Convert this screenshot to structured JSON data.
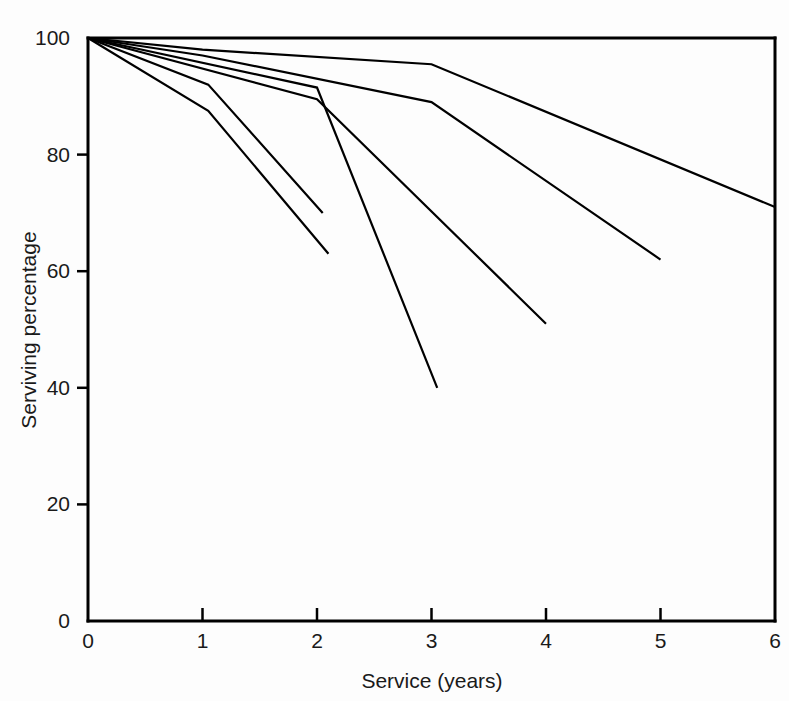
{
  "chart_data": {
    "type": "line",
    "title": "",
    "subtitle": "",
    "xlabel": "Service (years)",
    "ylabel": "Serviving percentage",
    "xlim": [
      0,
      6
    ],
    "ylim": [
      0,
      100
    ],
    "xticks": [
      0,
      1,
      2,
      3,
      4,
      5,
      6
    ],
    "xticklabels": [
      "0",
      "1",
      "2",
      "3",
      "4",
      "5",
      "6"
    ],
    "yticks": [
      0,
      20,
      40,
      60,
      80,
      100
    ],
    "yticklabels": [
      "0",
      "20",
      "40",
      "60",
      "80",
      "100"
    ],
    "grid": false,
    "legend": null,
    "legend_position": "none",
    "annotations": [],
    "series": [
      {
        "name": "cohort-1",
        "x": [
          0,
          1,
          3,
          6
        ],
        "values": [
          100,
          98,
          95.5,
          71
        ]
      },
      {
        "name": "cohort-2",
        "x": [
          0,
          1,
          3,
          5
        ],
        "values": [
          100,
          97,
          89,
          62
        ]
      },
      {
        "name": "cohort-3",
        "x": [
          0,
          2,
          4
        ],
        "values": [
          100,
          89.5,
          51
        ]
      },
      {
        "name": "cohort-4",
        "x": [
          0,
          2,
          3.05
        ],
        "values": [
          100,
          91.5,
          40
        ]
      },
      {
        "name": "cohort-5",
        "x": [
          0,
          1.05,
          2.05
        ],
        "values": [
          100,
          92,
          70
        ]
      },
      {
        "name": "cohort-6",
        "x": [
          0,
          1.05,
          2.1
        ],
        "values": [
          100,
          87.5,
          63
        ]
      }
    ]
  },
  "axes": {
    "y_title": "Serviving percentage",
    "x_title": "Service (years)"
  }
}
